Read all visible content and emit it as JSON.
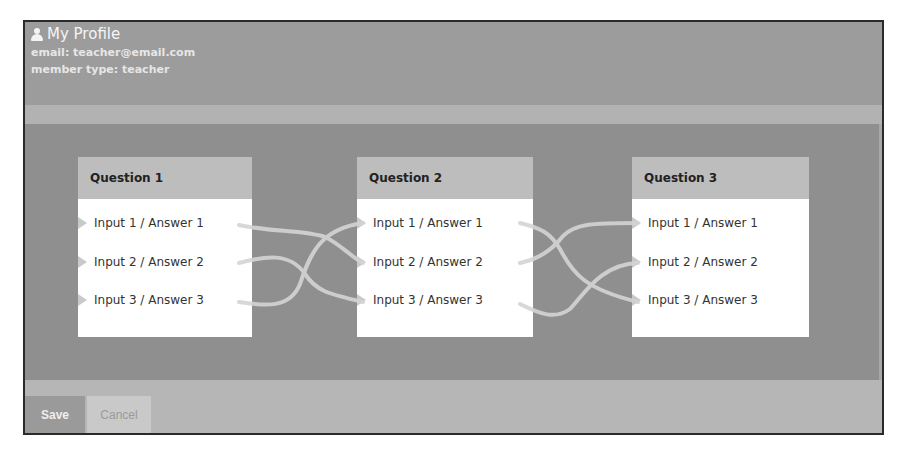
{
  "profile": {
    "icon": "user-icon",
    "title": "My Profile",
    "email_line": "email: teacher@email.com",
    "member_line": "member type: teacher"
  },
  "questions": [
    {
      "title": "Question 1",
      "rows": [
        "Input 1 / Answer 1",
        "Input 2 / Answer 2",
        "Input 3 / Answer 3"
      ]
    },
    {
      "title": "Question 2",
      "rows": [
        "Input 1 / Answer 1",
        "Input 2 / Answer 2",
        "Input 3 / Answer 3"
      ]
    },
    {
      "title": "Question 3",
      "rows": [
        "Input 1 / Answer 1",
        "Input 2 / Answer 2",
        "Input 3 / Answer 3"
      ]
    }
  ],
  "connections": [
    {
      "from": "Question 1 / row 1",
      "to": "Question 2 / row 2"
    },
    {
      "from": "Question 1 / row 2",
      "to": "Question 2 / row 3"
    },
    {
      "from": "Question 1 / row 3",
      "to": "Question 2 / row 1"
    },
    {
      "from": "Question 2 / row 1",
      "to": "Question 3 / row 3"
    },
    {
      "from": "Question 2 / row 2",
      "to": "Question 3 / row 1"
    },
    {
      "from": "Question 2 / row 3",
      "to": "Question 3 / row 2"
    }
  ],
  "footer": {
    "save_label": "Save",
    "cancel_label": "Cancel"
  },
  "colors": {
    "frame_border": "#2a2a2a",
    "header_bg": "#9c9c9c",
    "stripe_bg": "#b2b2b2",
    "main_bg": "#8f8f8f",
    "card_header_bg": "#bdbdbd",
    "card_body_bg": "#ffffff",
    "connector": "#d4d4d4",
    "footer_bg": "#b6b6b6",
    "save_bg": "#9a9a9a",
    "cancel_bg": "#c9c9c9"
  }
}
